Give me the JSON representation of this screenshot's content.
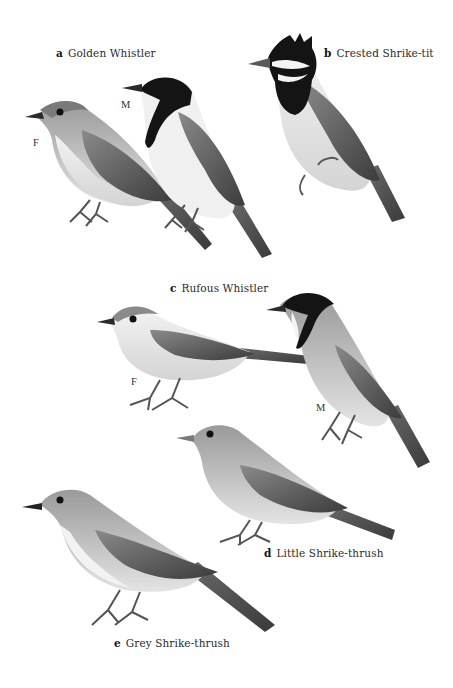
{
  "plate": {
    "background": "#ffffff",
    "style": "grayscale field guide illustration",
    "species": [
      {
        "letter": "a",
        "name": "Golden Whistler",
        "figures": [
          {
            "sex_label": "F"
          },
          {
            "sex_label": "M"
          }
        ]
      },
      {
        "letter": "b",
        "name": "Crested Shrike-tit",
        "figures": []
      },
      {
        "letter": "c",
        "name": "Rufous Whistler",
        "figures": [
          {
            "sex_label": "F"
          },
          {
            "sex_label": "M"
          }
        ]
      },
      {
        "letter": "d",
        "name": "Little Shrike-thrush",
        "figures": []
      },
      {
        "letter": "e",
        "name": "Grey Shrike-thrush",
        "figures": []
      }
    ]
  },
  "colors": {
    "black_plumage": "#141414",
    "dark_wing": "#4a4a4a",
    "mid_grey": "#7d7d7d",
    "light_grey": "#b3b3b3",
    "pale_belly": "#e2e2e2",
    "white_throat": "#f4f4f4"
  }
}
